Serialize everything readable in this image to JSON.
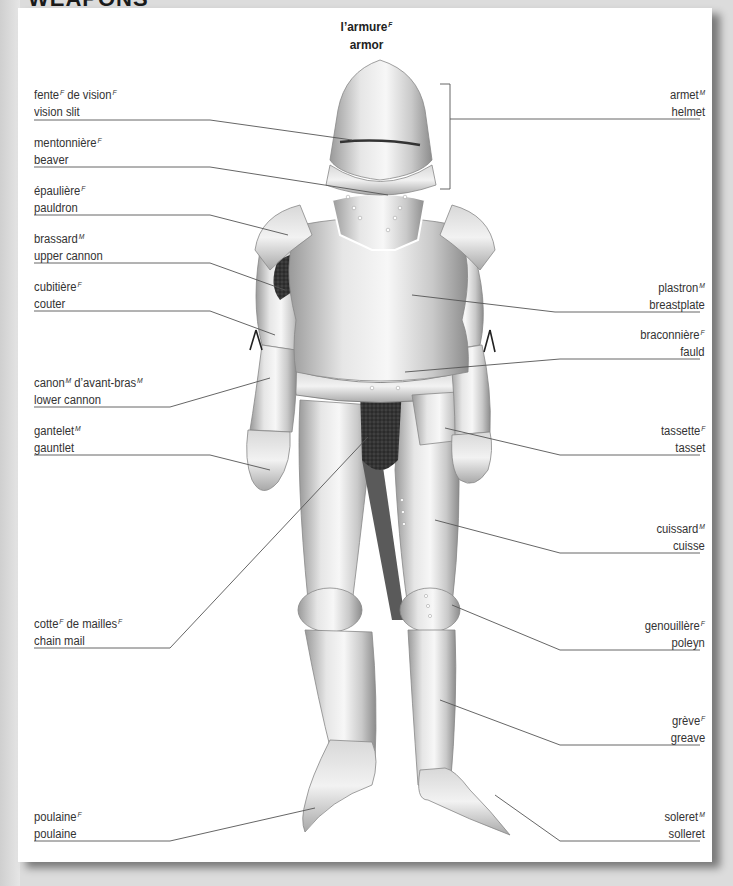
{
  "section": {
    "title": "WEAPONS"
  },
  "header": {
    "title_fr": "l’armure",
    "title_fr_gender": "F",
    "title_en": "armor"
  },
  "labels": {
    "left": [
      {
        "id": "vision-slit",
        "fr": [
          {
            "w": "fente",
            "g": "F"
          },
          {
            "w": " de vision",
            "g": "F"
          }
        ],
        "fr_text": "fente de vision",
        "en": "vision slit"
      },
      {
        "id": "beaver",
        "fr": [
          {
            "w": "mentonnière",
            "g": "F"
          }
        ],
        "fr_text": "mentonnière",
        "en": "beaver"
      },
      {
        "id": "pauldron",
        "fr": [
          {
            "w": "épaulière",
            "g": "F"
          }
        ],
        "fr_text": "épaulière",
        "en": "pauldron"
      },
      {
        "id": "upper-cannon",
        "fr": [
          {
            "w": "brassard",
            "g": "M"
          }
        ],
        "fr_text": "brassard",
        "en": "upper cannon"
      },
      {
        "id": "couter",
        "fr": [
          {
            "w": "cubitière",
            "g": "F"
          }
        ],
        "fr_text": "cubitière",
        "en": "couter"
      },
      {
        "id": "lower-cannon",
        "fr": [
          {
            "w": "canon",
            "g": "M"
          },
          {
            "w": " d’avant-bras",
            "g": "M"
          }
        ],
        "fr_text": "canon d’avant-bras",
        "en": "lower cannon"
      },
      {
        "id": "gauntlet",
        "fr": [
          {
            "w": "gantelet",
            "g": "M"
          }
        ],
        "fr_text": "gantelet",
        "en": "gauntlet"
      },
      {
        "id": "chain-mail",
        "fr": [
          {
            "w": "cotte",
            "g": "F"
          },
          {
            "w": " de mailles",
            "g": "F"
          }
        ],
        "fr_text": "cotte de mailles",
        "en": "chain mail"
      },
      {
        "id": "poulaine",
        "fr": [
          {
            "w": "poulaine",
            "g": "F"
          }
        ],
        "fr_text": "poulaine",
        "en": "poulaine"
      }
    ],
    "right": [
      {
        "id": "helmet",
        "fr": [
          {
            "w": "armet",
            "g": "M"
          }
        ],
        "fr_text": "armet",
        "en": "helmet"
      },
      {
        "id": "breastplate",
        "fr": [
          {
            "w": "plastron",
            "g": "M"
          }
        ],
        "fr_text": "plastron",
        "en": "breastplate"
      },
      {
        "id": "fauld",
        "fr": [
          {
            "w": "braconnière",
            "g": "F"
          }
        ],
        "fr_text": "braconnière",
        "en": "fauld"
      },
      {
        "id": "tasset",
        "fr": [
          {
            "w": "tassette",
            "g": "F"
          }
        ],
        "fr_text": "tassette",
        "en": "tasset"
      },
      {
        "id": "cuisse",
        "fr": [
          {
            "w": "cuissard",
            "g": "M"
          }
        ],
        "fr_text": "cuissard",
        "en": "cuisse"
      },
      {
        "id": "poleyn",
        "fr": [
          {
            "w": "genouillère",
            "g": "F"
          }
        ],
        "fr_text": "genouillère",
        "en": "poleyn"
      },
      {
        "id": "greave",
        "fr": [
          {
            "w": "grève",
            "g": "F"
          }
        ],
        "fr_text": "grève",
        "en": "greave"
      },
      {
        "id": "solleret",
        "fr": [
          {
            "w": "soleret",
            "g": "M"
          }
        ],
        "fr_text": "soleret",
        "en": "solleret"
      }
    ]
  },
  "colors": {
    "page_bg": "#dcdcdc",
    "card_bg": "#ffffff",
    "text": "#333333",
    "leader_line": "#555555",
    "metal_light": "#f2f2f2",
    "metal_mid": "#c4c4c4",
    "metal_dark": "#8a8a8a",
    "chain_mail": "#2a2a2a"
  }
}
